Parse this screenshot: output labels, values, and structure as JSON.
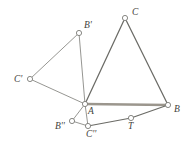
{
  "figure": {
    "width": 190,
    "height": 148,
    "background_color": "#ffffff",
    "colors": {
      "thin_edge": "#8a8a86",
      "main_edge": "#6b6b66",
      "thick_edge": "#9b968d",
      "node_fill": "#ffffff",
      "node_stroke": "#7c7c77",
      "label_text": "#3f3f3c"
    },
    "vertices": [
      {
        "id": "C",
        "label": "C",
        "x": 125,
        "y": 18,
        "r": 2.6,
        "label_x": 132,
        "label_y": 8
      },
      {
        "id": "Bprime",
        "label": "B'",
        "x": 79,
        "y": 33,
        "r": 2.6,
        "label_x": 84,
        "label_y": 21
      },
      {
        "id": "Cprime",
        "label": "C'",
        "x": 30,
        "y": 79,
        "r": 2.6,
        "label_x": 14,
        "label_y": 75
      },
      {
        "id": "A",
        "label": "A",
        "x": 85,
        "y": 104,
        "r": 2.6,
        "label_x": 88,
        "label_y": 107
      },
      {
        "id": "B",
        "label": "B",
        "x": 168,
        "y": 105,
        "r": 2.6,
        "label_x": 174,
        "label_y": 105
      },
      {
        "id": "T",
        "label": "T",
        "x": 131,
        "y": 118,
        "r": 2.6,
        "label_x": 128,
        "label_y": 122
      },
      {
        "id": "Cdbl",
        "label": "C''",
        "x": 88,
        "y": 126,
        "r": 2.6,
        "label_x": 86,
        "label_y": 130
      },
      {
        "id": "Bdbl",
        "label": "B''",
        "x": 72,
        "y": 121,
        "r": 2.6,
        "label_x": 55,
        "label_y": 122
      }
    ],
    "edges": [
      {
        "id": "edge-A-C",
        "from": "A",
        "to": "C",
        "style": "main"
      },
      {
        "id": "edge-C-B",
        "from": "C",
        "to": "B",
        "style": "main"
      },
      {
        "id": "edge-A-B",
        "from": "A",
        "to": "B",
        "style": "thick"
      },
      {
        "id": "edge-A-Bprime",
        "from": "A",
        "to": "Bprime",
        "style": "thin"
      },
      {
        "id": "edge-Bprime-Cprime",
        "from": "Bprime",
        "to": "Cprime",
        "style": "thin"
      },
      {
        "id": "edge-Cprime-A",
        "from": "Cprime",
        "to": "A",
        "style": "thin"
      },
      {
        "id": "edge-A-Bdbl",
        "from": "A",
        "to": "Bdbl",
        "style": "thin"
      },
      {
        "id": "edge-Bdbl-Cdbl",
        "from": "Bdbl",
        "to": "Cdbl",
        "style": "thin"
      },
      {
        "id": "edge-A-Cdbl",
        "from": "A",
        "to": "Cdbl",
        "style": "thin"
      },
      {
        "id": "edge-Cdbl-T",
        "from": "Cdbl",
        "to": "T",
        "style": "main"
      },
      {
        "id": "edge-T-B",
        "from": "T",
        "to": "B",
        "style": "main"
      }
    ]
  }
}
